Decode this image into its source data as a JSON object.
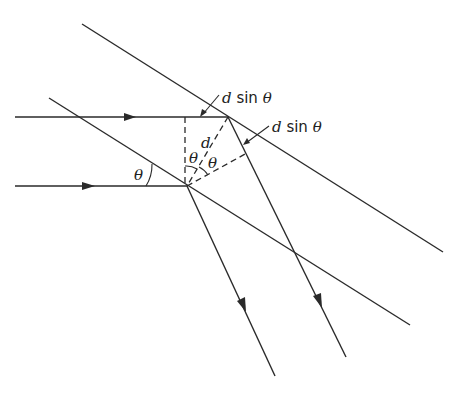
{
  "diagram": {
    "labels": {
      "path_diff_top": {
        "var": "d",
        "fn": " sin ",
        "angle": "θ"
      },
      "path_diff_right": {
        "var": "d",
        "fn": " sin ",
        "angle": "θ"
      },
      "spacing": "d",
      "theta_incident": "θ",
      "theta_left": "θ",
      "theta_right": "θ"
    },
    "elements": {
      "planes": [
        {
          "name": "upper-crystal-plane",
          "from": [
            82,
            24
          ],
          "to": [
            443,
            252
          ]
        },
        {
          "name": "lower-crystal-plane",
          "from": [
            49,
            98
          ],
          "to": [
            410,
            325
          ]
        }
      ],
      "incident_rays": [
        {
          "name": "incident-ray-top",
          "from": [
            15,
            117
          ],
          "to": [
            228,
            117
          ]
        },
        {
          "name": "incident-ray-bottom",
          "from": [
            15,
            186
          ],
          "to": [
            187,
            186
          ]
        }
      ],
      "reflected_rays": [
        {
          "name": "reflected-ray-top",
          "from": [
            228,
            117
          ],
          "to": [
            346,
            357
          ]
        },
        {
          "name": "reflected-ray-bottom",
          "from": [
            187,
            186
          ],
          "to": [
            275,
            376
          ]
        }
      ],
      "construction_lines": [
        {
          "name": "vertical-dashed-line",
          "from": [
            185,
            117
          ],
          "to": [
            185,
            186
          ]
        },
        {
          "name": "spacing-dashed-line",
          "from": [
            228,
            117
          ],
          "to": [
            187,
            186
          ]
        },
        {
          "name": "perpendicular-dashed-line",
          "from": [
            187,
            186
          ],
          "to": [
            247,
            153
          ]
        }
      ]
    },
    "colors": {
      "ink": "#2a2a2a",
      "background": "#ffffff"
    }
  }
}
